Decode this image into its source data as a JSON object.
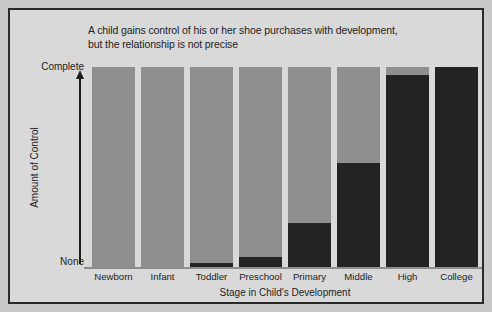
{
  "chart_data": {
    "type": "bar",
    "title": "A child gains control of his or her shoe purchases with development, but the relationship is not precise",
    "title_line1": "A child gains control of his or her shoe purchases with development,",
    "title_line2": "but the relationship is not precise",
    "xlabel": "Stage in Child's Development",
    "ylabel": "Amount of Control",
    "y_tick_top": "Complete",
    "y_tick_bottom": "None",
    "ylim": [
      0,
      100
    ],
    "grid": false,
    "legend": "none",
    "stacked": true,
    "categories": [
      "Newborn",
      "Infant",
      "Toddler",
      "Preschool",
      "Primary",
      "Middle",
      "High",
      "College"
    ],
    "series": [
      {
        "name": "Child control",
        "color": "#232323",
        "values": [
          0,
          0,
          2,
          5,
          22,
          52,
          96,
          100
        ]
      },
      {
        "name": "Parent control",
        "color": "#8f8f8f",
        "values": [
          100,
          100,
          98,
          95,
          78,
          48,
          4,
          0
        ]
      }
    ]
  },
  "colors": {
    "dark": "#232323",
    "gray": "#8f8f8f",
    "background": "#d9d9d9",
    "frame": "#2a2a2a",
    "axis": "#8d8d8d",
    "text": "#1d1d1d"
  }
}
